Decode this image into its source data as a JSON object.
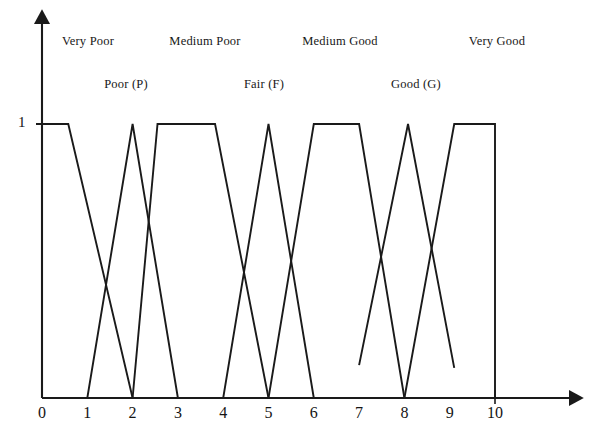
{
  "figure": {
    "title": "",
    "background_color": "#ffffff",
    "line_color": "#1a1a1a"
  },
  "axes": {
    "y_axis": {
      "label": "",
      "ticks": [
        {
          "value": 1,
          "text": "1"
        }
      ],
      "range": [
        0,
        1
      ]
    },
    "x_axis": {
      "label": "",
      "ticks": [
        {
          "value": 0,
          "text": "0"
        },
        {
          "value": 1,
          "text": "1"
        },
        {
          "value": 2,
          "text": "2"
        },
        {
          "value": 3,
          "text": "3"
        },
        {
          "value": 4,
          "text": "4"
        },
        {
          "value": 5,
          "text": "5"
        },
        {
          "value": 6,
          "text": "6"
        },
        {
          "value": 7,
          "text": "7"
        },
        {
          "value": 8,
          "text": "8"
        },
        {
          "value": 9,
          "text": "9"
        },
        {
          "value": 10,
          "text": "10"
        }
      ],
      "range": [
        0,
        10
      ]
    }
  },
  "annotations": {
    "upper_row": [
      {
        "text": "Very Poor",
        "x": 1.62
      },
      {
        "text": "Medium Poor",
        "x": 4.07
      },
      {
        "text": "Medium Good",
        "x": 6.98
      },
      {
        "text": "Very Good",
        "x": 10.05
      }
    ],
    "lower_row": [
      {
        "text": "Poor (P)",
        "x": 2.85
      },
      {
        "text": "Fair (F)",
        "x": 5.88
      },
      {
        "text": "Good (G)",
        "x": 8.24
      }
    ]
  },
  "chart_data": {
    "type": "line",
    "title": "",
    "xlabel": "",
    "ylabel": "",
    "xlim": [
      0,
      10
    ],
    "ylim": [
      0,
      1
    ],
    "grid": false,
    "legend": "none",
    "series": [
      {
        "name": "Very Poor",
        "shape": "trapezoid",
        "points": [
          {
            "x": 0.0,
            "y": 1.0
          },
          {
            "x": 0.58,
            "y": 1.0
          },
          {
            "x": 2.0,
            "y": 0.0
          }
        ]
      },
      {
        "name": "Poor (P)",
        "shape": "triangle",
        "points": [
          {
            "x": 1.0,
            "y": 0.0
          },
          {
            "x": 2.0,
            "y": 1.0
          },
          {
            "x": 3.0,
            "y": 0.0
          }
        ]
      },
      {
        "name": "Medium Poor",
        "shape": "trapezoid",
        "points": [
          {
            "x": 2.0,
            "y": 0.0
          },
          {
            "x": 2.55,
            "y": 1.0
          },
          {
            "x": 3.82,
            "y": 1.0
          },
          {
            "x": 5.0,
            "y": 0.0
          }
        ]
      },
      {
        "name": "Fair (F)",
        "shape": "triangle",
        "points": [
          {
            "x": 4.0,
            "y": 0.0
          },
          {
            "x": 5.0,
            "y": 1.0
          },
          {
            "x": 6.0,
            "y": 0.0
          }
        ]
      },
      {
        "name": "Medium Good",
        "shape": "trapezoid",
        "points": [
          {
            "x": 5.0,
            "y": 0.0
          },
          {
            "x": 6.0,
            "y": 1.0
          },
          {
            "x": 7.0,
            "y": 1.0
          },
          {
            "x": 8.0,
            "y": 0.0
          }
        ]
      },
      {
        "name": "Good (G)",
        "shape": "triangle",
        "points": [
          {
            "x": 7.0,
            "y": 0.12
          },
          {
            "x": 8.08,
            "y": 1.0
          },
          {
            "x": 9.1,
            "y": 0.11
          }
        ]
      },
      {
        "name": "Very Good",
        "shape": "trapezoid",
        "points": [
          {
            "x": 8.0,
            "y": 0.0
          },
          {
            "x": 9.1,
            "y": 1.0
          },
          {
            "x": 10.0,
            "y": 1.0
          },
          {
            "x": 10.0,
            "y": 0.0
          }
        ]
      }
    ]
  }
}
